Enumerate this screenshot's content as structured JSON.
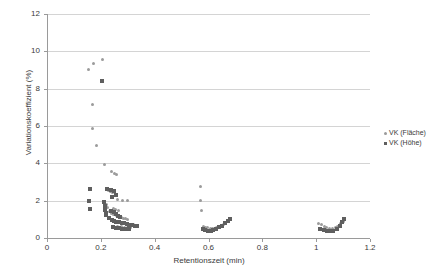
{
  "chart_data": {
    "type": "scatter",
    "title": "",
    "xlabel": "Retentionszeit (min)",
    "ylabel": "Variationskoeffizient (%)",
    "xlim": [
      0,
      1.2
    ],
    "ylim": [
      0,
      12
    ],
    "xticks": [
      "0",
      "0.2",
      "0.4",
      "0.6",
      "0.8",
      "1",
      "1.2"
    ],
    "xtick_values": [
      0,
      0.2,
      0.4,
      0.6,
      0.8,
      1.0,
      1.2
    ],
    "yticks": [
      "0",
      "2",
      "4",
      "6",
      "8",
      "10",
      "12"
    ],
    "ytick_values": [
      0,
      2,
      4,
      6,
      8,
      10,
      12
    ],
    "grid": "horizontal",
    "legend_position": "right",
    "legend": [
      {
        "name": "VK (Fläche)",
        "marker": "diamond",
        "color": "#9b9b9b"
      },
      {
        "name": "VK (Höhe)",
        "marker": "square",
        "color": "#5f5f5f"
      }
    ],
    "series": [
      {
        "name": "VK (Fläche)",
        "marker": "diamond",
        "color": "#9b9b9b",
        "points": [
          [
            0.155,
            9.05
          ],
          [
            0.172,
            9.35
          ],
          [
            0.205,
            9.55
          ],
          [
            0.168,
            7.15
          ],
          [
            0.168,
            5.85
          ],
          [
            0.185,
            4.95
          ],
          [
            0.215,
            3.95
          ],
          [
            0.238,
            3.55
          ],
          [
            0.252,
            3.45
          ],
          [
            0.258,
            3.4
          ],
          [
            0.228,
            2.55
          ],
          [
            0.236,
            2.5
          ],
          [
            0.244,
            2.42
          ],
          [
            0.262,
            2.05
          ],
          [
            0.28,
            2.02
          ],
          [
            0.3,
            2.0
          ],
          [
            0.214,
            1.95
          ],
          [
            0.222,
            1.8
          ],
          [
            0.226,
            1.62
          ],
          [
            0.246,
            1.6
          ],
          [
            0.255,
            1.55
          ],
          [
            0.266,
            1.48
          ],
          [
            0.232,
            1.4
          ],
          [
            0.24,
            1.32
          ],
          [
            0.248,
            1.26
          ],
          [
            0.258,
            1.22
          ],
          [
            0.268,
            1.16
          ],
          [
            0.276,
            1.12
          ],
          [
            0.284,
            1.06
          ],
          [
            0.292,
            1.02
          ],
          [
            0.3,
            0.98
          ],
          [
            0.24,
            0.95
          ],
          [
            0.25,
            0.9
          ],
          [
            0.262,
            0.86
          ],
          [
            0.272,
            0.82
          ],
          [
            0.282,
            0.8
          ],
          [
            0.295,
            0.76
          ],
          [
            0.31,
            0.72
          ],
          [
            0.322,
            0.7
          ],
          [
            0.334,
            0.68
          ],
          [
            0.262,
            0.64
          ],
          [
            0.275,
            0.6
          ],
          [
            0.288,
            0.58
          ],
          [
            0.3,
            0.56
          ],
          [
            0.312,
            0.54
          ],
          [
            0.57,
            2.75
          ],
          [
            0.572,
            2.0
          ],
          [
            0.575,
            1.45
          ],
          [
            0.582,
            0.62
          ],
          [
            0.59,
            0.58
          ],
          [
            0.598,
            0.54
          ],
          [
            0.606,
            0.52
          ],
          [
            0.614,
            0.5
          ],
          [
            0.622,
            0.5
          ],
          [
            0.63,
            0.56
          ],
          [
            0.64,
            0.62
          ],
          [
            0.648,
            0.68
          ],
          [
            0.656,
            0.74
          ],
          [
            0.664,
            0.8
          ],
          [
            0.672,
            0.86
          ],
          [
            1.01,
            0.78
          ],
          [
            1.02,
            0.7
          ],
          [
            1.03,
            0.62
          ],
          [
            1.04,
            0.56
          ],
          [
            1.05,
            0.52
          ],
          [
            1.06,
            0.5
          ],
          [
            1.07,
            0.56
          ],
          [
            1.08,
            0.64
          ],
          [
            1.092,
            0.8
          ],
          [
            1.1,
            0.88
          ]
        ]
      },
      {
        "name": "VK (Höhe)",
        "marker": "square",
        "color": "#5f5f5f",
        "points": [
          [
            0.205,
            8.4
          ],
          [
            0.158,
            2.6
          ],
          [
            0.156,
            1.98
          ],
          [
            0.158,
            1.55
          ],
          [
            0.222,
            2.62
          ],
          [
            0.236,
            2.58
          ],
          [
            0.248,
            2.52
          ],
          [
            0.256,
            2.3
          ],
          [
            0.24,
            2.18
          ],
          [
            0.212,
            1.92
          ],
          [
            0.214,
            1.72
          ],
          [
            0.216,
            1.52
          ],
          [
            0.218,
            1.36
          ],
          [
            0.22,
            1.22
          ],
          [
            0.238,
            1.45
          ],
          [
            0.248,
            1.38
          ],
          [
            0.256,
            1.28
          ],
          [
            0.264,
            1.18
          ],
          [
            0.272,
            1.1
          ],
          [
            0.23,
            1.05
          ],
          [
            0.24,
            0.98
          ],
          [
            0.25,
            0.92
          ],
          [
            0.258,
            0.88
          ],
          [
            0.268,
            0.84
          ],
          [
            0.278,
            0.8
          ],
          [
            0.286,
            0.78
          ],
          [
            0.296,
            0.74
          ],
          [
            0.306,
            0.7
          ],
          [
            0.316,
            0.68
          ],
          [
            0.326,
            0.66
          ],
          [
            0.336,
            0.64
          ],
          [
            0.244,
            0.6
          ],
          [
            0.256,
            0.56
          ],
          [
            0.268,
            0.52
          ],
          [
            0.28,
            0.5
          ],
          [
            0.292,
            0.48
          ],
          [
            0.304,
            0.46
          ],
          [
            0.578,
            0.46
          ],
          [
            0.588,
            0.42
          ],
          [
            0.598,
            0.4
          ],
          [
            0.608,
            0.4
          ],
          [
            0.618,
            0.44
          ],
          [
            0.628,
            0.5
          ],
          [
            0.638,
            0.58
          ],
          [
            0.65,
            0.66
          ],
          [
            0.662,
            0.78
          ],
          [
            0.672,
            0.9
          ],
          [
            0.68,
            1.0
          ],
          [
            1.015,
            0.5
          ],
          [
            1.028,
            0.44
          ],
          [
            1.04,
            0.4
          ],
          [
            1.052,
            0.38
          ],
          [
            1.064,
            0.4
          ],
          [
            1.076,
            0.5
          ],
          [
            1.088,
            0.66
          ],
          [
            1.096,
            0.84
          ],
          [
            1.102,
            1.0
          ]
        ]
      }
    ]
  }
}
